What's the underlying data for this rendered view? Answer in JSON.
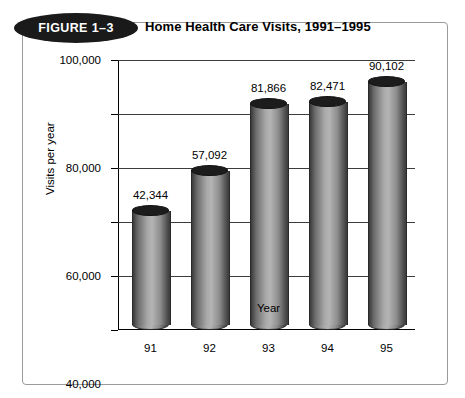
{
  "figure": {
    "badge_label": "FIGURE 1–3",
    "title": "Home Health Care Visits, 1991–1995"
  },
  "colors": {
    "frame_border": "#9a9a9a",
    "badge_fill": "#1a1a1a",
    "badge_text": "#ffffff",
    "axis": "#000000",
    "gridline": "#3c3c3c",
    "cylinder_cap": "#1c1c1c",
    "cylinder_light": "#b4b4b4",
    "cylinder_dark": "#3a3a3a"
  },
  "chart_data": {
    "type": "bar",
    "title": "Home Health Care Visits, 1991–1995",
    "xlabel": "Year",
    "ylabel": "Visits per year",
    "categories": [
      "91",
      "92",
      "93",
      "94",
      "95"
    ],
    "values": [
      42344,
      57092,
      81866,
      82471,
      90102
    ],
    "value_labels": [
      "42,344",
      "57,092",
      "81,866",
      "82,471",
      "90,102"
    ],
    "ylim": [
      0,
      100000
    ],
    "ytick_values": [
      0,
      20000,
      40000,
      60000,
      80000,
      100000
    ],
    "ytick_labels": [
      "0",
      "20,000",
      "40,000",
      "60,000",
      "80,000",
      "100,000"
    ],
    "grid": true,
    "legend": false,
    "style": "3d-cylinder"
  }
}
